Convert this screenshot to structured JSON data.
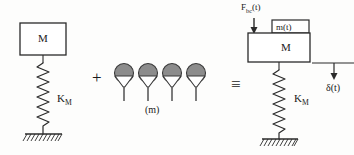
{
  "diagram": {
    "operators": {
      "plus": "+",
      "equivalence": "≡"
    },
    "left_system": {
      "mass_label": "M",
      "spring_label_main": "K",
      "spring_label_sub": "M",
      "ground": "fixed-support-hatching"
    },
    "absorbers": {
      "count": 4,
      "mass_label": "(m)",
      "body_color": "#8c8c8c",
      "outline_color": "#3a3a3a"
    },
    "right_system": {
      "force_label_main": "F",
      "force_label_sub": "bc",
      "force_label_tail": "(t)",
      "force_label_full": "F_bc(t)",
      "top_mass_label": "m(t)",
      "mass_label": "M",
      "spring_label_main": "K",
      "spring_label_sub": "M",
      "displacement_label": "δ(t)",
      "ground": "fixed-support-hatching"
    },
    "colors": {
      "stroke": "#2a2a2a",
      "fill_gray": "#8c8c8c",
      "background": "#fdfdfc"
    }
  }
}
